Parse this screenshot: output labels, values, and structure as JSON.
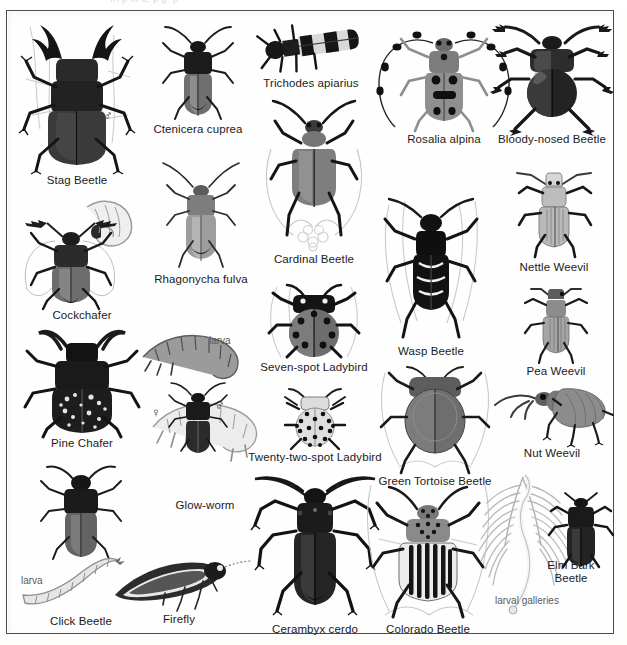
{
  "plate": {
    "title": "Beetles",
    "frame_color": "#4a4a4a",
    "background_color": "#fefefe",
    "caption_color": "#1b1b1b",
    "minor_label_color": "#5a5a5a",
    "top_strip_ghost_text": "tri p         m                a,      p         g.    p"
  },
  "symbols": {
    "male": "♂",
    "female": "♀"
  },
  "minor_labels": {
    "larva": "larva",
    "larval_galleries": "larval galleries"
  },
  "specimens": [
    {
      "id": "stag-beetle",
      "name": "Stag Beetle",
      "sex": "♂",
      "minor": null,
      "col": 1,
      "row": 1
    },
    {
      "id": "cockchafer",
      "name": "Cockchafer",
      "sex": null,
      "minor": null,
      "col": 1,
      "row": 2
    },
    {
      "id": "pine-chafer",
      "name": "Pine Chafer",
      "sex": null,
      "minor": null,
      "col": 1,
      "row": 3
    },
    {
      "id": "click-beetle",
      "name": "Click Beetle",
      "sex": null,
      "minor": "larva",
      "col": 1,
      "row": 4
    },
    {
      "id": "ctenicera-cuprea",
      "name": "Ctenicera cuprea",
      "sex": null,
      "minor": null,
      "col": 2,
      "row": 1
    },
    {
      "id": "rhagonycha-fulva",
      "name": "Rhagonycha fulva",
      "sex": null,
      "minor": null,
      "col": 2,
      "row": 2
    },
    {
      "id": "glow-worm",
      "name": "Glow-worm",
      "sex": "♀",
      "minor": "larva",
      "col": 2,
      "row": 3
    },
    {
      "id": "firefly",
      "name": "Firefly",
      "sex": "♂",
      "minor": null,
      "col": 2,
      "row": 4
    },
    {
      "id": "trichodes-apiarius",
      "name": "Trichodes apiarius",
      "sex": null,
      "minor": null,
      "col": 3,
      "row": 1
    },
    {
      "id": "cardinal-beetle",
      "name": "Cardinal Beetle",
      "sex": null,
      "minor": null,
      "col": 3,
      "row": 2
    },
    {
      "id": "seven-spot-ladybird",
      "name": "Seven-spot Ladybird",
      "sex": null,
      "minor": null,
      "col": 3,
      "row": 3
    },
    {
      "id": "twenty-two-spot-ladybird",
      "name": "Twenty-two-spot Ladybird",
      "sex": null,
      "minor": null,
      "col": 3,
      "row": 4
    },
    {
      "id": "cerambyx-cerdo",
      "name": "Cerambyx cerdo",
      "sex": null,
      "minor": null,
      "col": 3,
      "row": 5
    },
    {
      "id": "rosalia-alpina",
      "name": "Rosalia alpina",
      "sex": null,
      "minor": null,
      "col": 4,
      "row": 1
    },
    {
      "id": "wasp-beetle",
      "name": "Wasp Beetle",
      "sex": null,
      "minor": null,
      "col": 4,
      "row": 2
    },
    {
      "id": "green-tortoise-beetle",
      "name": "Green Tortoise Beetle",
      "sex": null,
      "minor": null,
      "col": 4,
      "row": 3
    },
    {
      "id": "colorado-beetle",
      "name": "Colorado Beetle",
      "sex": null,
      "minor": null,
      "col": 4,
      "row": 4
    },
    {
      "id": "bloody-nosed-beetle",
      "name": "Bloody-nosed Beetle",
      "sex": null,
      "minor": null,
      "col": 5,
      "row": 1
    },
    {
      "id": "nettle-weevil",
      "name": "Nettle Weevil",
      "sex": null,
      "minor": null,
      "col": 5,
      "row": 2
    },
    {
      "id": "pea-weevil",
      "name": "Pea Weevil",
      "sex": null,
      "minor": null,
      "col": 5,
      "row": 3
    },
    {
      "id": "nut-weevil",
      "name": "Nut Weevil",
      "sex": null,
      "minor": null,
      "col": 5,
      "row": 4
    },
    {
      "id": "elm-bark-beetle",
      "name": "Elm Bark Beetle",
      "sex": null,
      "minor": "larval galleries",
      "col": 5,
      "row": 5
    }
  ]
}
